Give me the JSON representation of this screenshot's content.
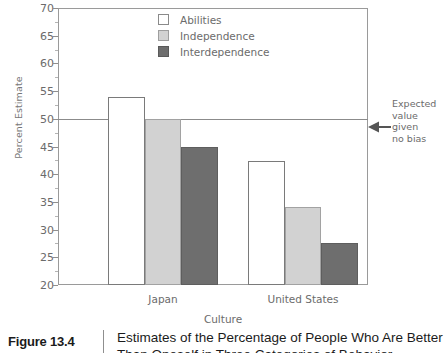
{
  "figure": {
    "number": "Figure 13.4",
    "caption_line1": "Estimates of the Percentage of People Who Are Better",
    "caption_line2": "Than Oneself in Three Categories of Behavior"
  },
  "annotation": {
    "line1": "Expected",
    "line2": "value",
    "line3": "given",
    "line4": "no bias",
    "arrow_icon": "arrow-left-icon",
    "value": 50
  },
  "legend": {
    "position": "top-center",
    "items": [
      {
        "label": "Abilities",
        "color": "#ffffff",
        "key": "abilities"
      },
      {
        "label": "Independence",
        "color": "#d2d2d2",
        "key": "independence"
      },
      {
        "label": "Interdependence",
        "color": "#6e6e6e",
        "key": "interdependence"
      }
    ]
  },
  "chart_data": {
    "type": "bar",
    "title": "Estimates of the Percentage of People Who Are Better Than Oneself in Three Categories of Behavior",
    "xlabel": "Culture",
    "ylabel": "Percent Estimate",
    "categories": [
      "Japan",
      "United States"
    ],
    "series": [
      {
        "name": "Abilities",
        "values": [
          54.0,
          42.3
        ],
        "color": "#ffffff"
      },
      {
        "name": "Independence",
        "values": [
          50.0,
          34.0
        ],
        "color": "#d2d2d2"
      },
      {
        "name": "Interdependence",
        "values": [
          45.0,
          27.5
        ],
        "color": "#6e6e6e"
      }
    ],
    "ylim": [
      20,
      70
    ],
    "ytick_step": 5,
    "yticks": [
      20,
      25,
      30,
      35,
      40,
      45,
      50,
      55,
      60,
      65,
      70
    ],
    "ytick_labels": [
      "20",
      "25",
      "30",
      "35",
      "40",
      "45",
      "50",
      "55",
      "60",
      "65",
      "70"
    ],
    "grid": false,
    "reference_line": {
      "value": 50,
      "label": "Expected value given no bias"
    }
  }
}
